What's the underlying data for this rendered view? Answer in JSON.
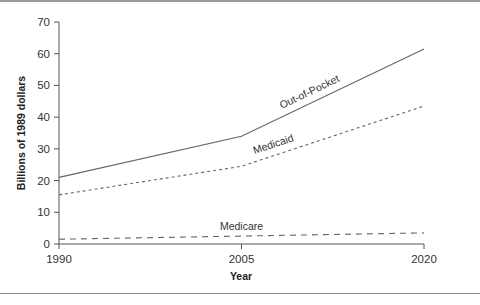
{
  "chart_data": {
    "type": "line",
    "title": "",
    "xlabel": "Year",
    "ylabel": "Billions of 1989 dollars",
    "x": [
      1990,
      2005,
      2020
    ],
    "xlim": [
      1990,
      2020
    ],
    "ylim": [
      0,
      70
    ],
    "xticks": [
      1990,
      2005,
      2020
    ],
    "yticks": [
      0,
      10,
      20,
      30,
      40,
      50,
      60,
      70
    ],
    "grid": false,
    "legend": "none (inline labels)",
    "series": [
      {
        "name": "Out-of-Pocket",
        "style": "solid",
        "values": [
          21,
          34,
          61.5
        ]
      },
      {
        "name": "Medicaid",
        "style": "dotted",
        "values": [
          15.5,
          24.5,
          43.5
        ]
      },
      {
        "name": "Medicare",
        "style": "dashed",
        "values": [
          1.5,
          2.5,
          3.5
        ]
      }
    ],
    "line_color": "#666666"
  }
}
